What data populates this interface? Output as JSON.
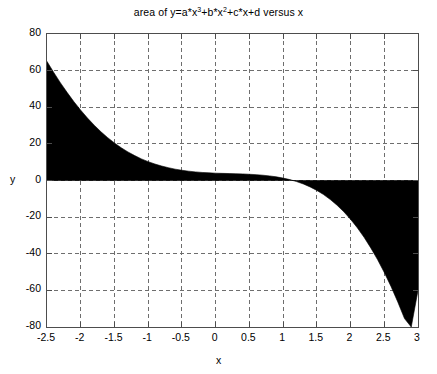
{
  "chart_data": {
    "type": "area",
    "title_parts": {
      "pre": "area of y=a*x",
      "sup1": "3",
      "mid1": "+b*x",
      "sup2": "2",
      "post": "+c*x+d versus x"
    },
    "xlabel": "x",
    "ylabel": "y",
    "xlim": [
      -2.5,
      3
    ],
    "ylim": [
      -80,
      80
    ],
    "xticks": [
      -2.5,
      -2,
      -1.5,
      -1,
      -0.5,
      0,
      0.5,
      1,
      1.5,
      2,
      2.5,
      3
    ],
    "xticklabels": [
      "-2.5",
      "-2",
      "-1.5",
      "-1",
      "-0.5",
      "0",
      "0.5",
      "1",
      "1.5",
      "2",
      "2.5",
      "3"
    ],
    "yticks": [
      -80,
      -60,
      -40,
      -20,
      0,
      20,
      40,
      60,
      80
    ],
    "yticklabels": [
      "-80",
      "-60",
      "-40",
      "-20",
      "0",
      "20",
      "40",
      "60",
      "80"
    ],
    "grid": true,
    "grid_style": "dashed",
    "grid_color": "#6e6e6e",
    "fill_color": "#000000",
    "axis_color": "#4d4d4d",
    "baseline": 0,
    "legend": null,
    "x": [
      -2.5,
      -2.4,
      -2.3,
      -2.2,
      -2.1,
      -2.0,
      -1.9,
      -1.8,
      -1.7,
      -1.6,
      -1.5,
      -1.4,
      -1.3,
      -1.2,
      -1.1,
      -1.0,
      -0.9,
      -0.8,
      -0.7,
      -0.6,
      -0.5,
      -0.4,
      -0.3,
      -0.2,
      -0.1,
      0.0,
      0.1,
      0.2,
      0.3,
      0.4,
      0.5,
      0.6,
      0.7,
      0.8,
      0.9,
      1.0,
      1.1,
      1.2,
      1.3,
      1.4,
      1.5,
      1.6,
      1.7,
      1.8,
      1.9,
      2.0,
      2.1,
      2.2,
      2.3,
      2.4,
      2.5,
      2.6,
      2.7,
      2.8,
      2.9,
      3.0
    ],
    "y": [
      65.0,
      59.0,
      53.3,
      48.0,
      43.0,
      38.4,
      34.1,
      30.2,
      26.6,
      23.4,
      20.5,
      17.9,
      15.6,
      13.6,
      11.8,
      10.3,
      9.0,
      7.9,
      7.0,
      6.2,
      5.6,
      5.1,
      4.7,
      4.4,
      4.2,
      4.0,
      3.9,
      3.8,
      3.7,
      3.6,
      3.4,
      3.2,
      2.9,
      2.5,
      2.0,
      1.3,
      0.5,
      -0.6,
      -1.9,
      -3.5,
      -5.4,
      -7.7,
      -10.4,
      -13.5,
      -17.1,
      -21.2,
      -25.8,
      -31.0,
      -36.8,
      -43.2,
      -50.2,
      -57.9,
      -66.3,
      -75.4,
      -85.2,
      -60.0
    ]
  }
}
